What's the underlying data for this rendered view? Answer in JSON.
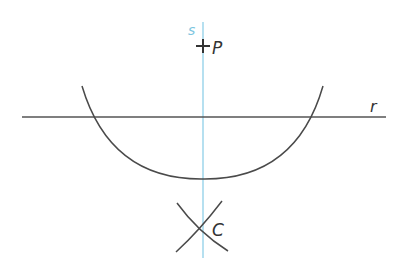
{
  "diagram": {
    "colors": {
      "stroke": "#4a4a4a",
      "perpendicular": "#8fd0e8",
      "label_s": "#7ec6e0",
      "text": "#333333"
    },
    "labels": {
      "point_p": "P",
      "point_c": "C",
      "line_r": "r",
      "line_s": "s"
    }
  }
}
